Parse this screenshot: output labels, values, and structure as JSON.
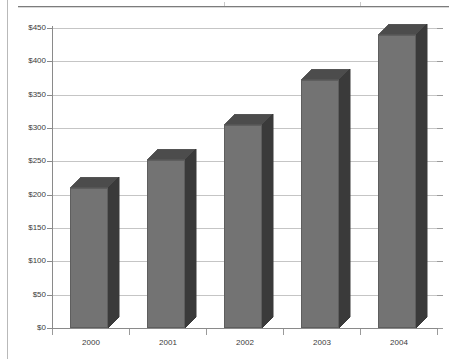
{
  "chart_data": {
    "type": "bar",
    "title": "",
    "subtitle": "",
    "xlabel": "",
    "ylabel": "",
    "categories": [
      "2000",
      "2001",
      "2002",
      "2003",
      "2004"
    ],
    "values": [
      210,
      252,
      305,
      372,
      440
    ],
    "value_prefix": "$",
    "ylim": [
      0,
      450
    ],
    "ytick_step": 50,
    "ytick_labels": [
      "$0",
      "$50",
      "$100",
      "$150",
      "$200",
      "$250",
      "$300",
      "$350",
      "$400",
      "$450"
    ],
    "ytick_values": [
      0,
      50,
      100,
      150,
      200,
      250,
      300,
      350,
      400,
      450
    ],
    "grid": true,
    "grid_axis": "y",
    "legend": false,
    "legend_position": "none",
    "style": "3d-column",
    "series": [
      {
        "name": "",
        "values": [
          210,
          252,
          305,
          372,
          440
        ]
      }
    ]
  },
  "colors": {
    "bar_front": "#737373",
    "bar_side": "#3a3a3a",
    "bar_top": "#4c4c4c",
    "bar_outline": "#5e5e5e",
    "gridline": "#c5c5c5",
    "axis": "#8a8a8a",
    "text": "#3b3b3b",
    "page_border": "#b9b9b9",
    "top_rule": "#7c7c7c",
    "background": "#ffffff"
  }
}
